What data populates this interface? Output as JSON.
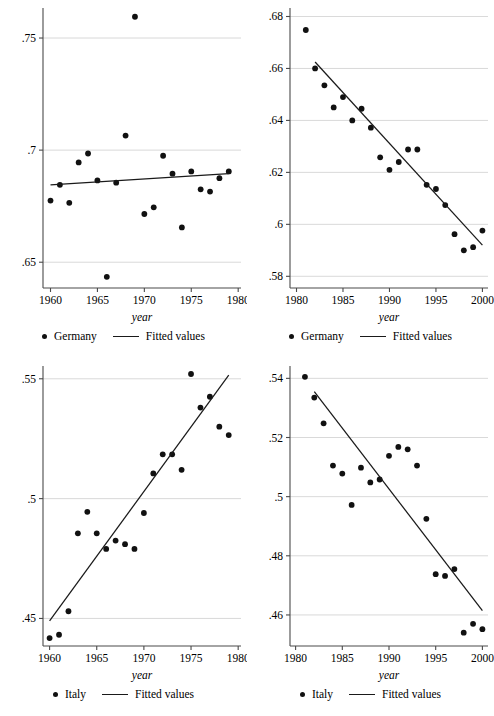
{
  "figure": {
    "panel_count": 4,
    "legend_marker_names": [
      "scatter-dot-marker",
      "fitted-line-marker"
    ]
  },
  "chart_data": [
    {
      "id": "germany-1960-1979",
      "type": "scatter",
      "title": "",
      "xlabel": "year",
      "ylabel": "",
      "xlim": [
        1959.2,
        1980.3
      ],
      "ylim": [
        0.6385,
        0.7625
      ],
      "xticks": [
        1960,
        1965,
        1970,
        1975,
        1980
      ],
      "xticklabels": [
        "1960",
        "1965",
        "1970",
        "1975",
        "1980"
      ],
      "yticks": [
        0.65,
        0.7,
        0.75
      ],
      "yticklabels": [
        ".65",
        ".7",
        ".75"
      ],
      "grid": true,
      "legend": [
        "Germany",
        "Fitted values"
      ],
      "legend_position": "bottom",
      "series": [
        {
          "name": "Germany",
          "kind": "points",
          "x": [
            1960,
            1961,
            1962,
            1963,
            1964,
            1965,
            1966,
            1967,
            1968,
            1969,
            1970,
            1971,
            1972,
            1973,
            1974,
            1975,
            1976,
            1977,
            1978,
            1979
          ],
          "y": [
            0.6775,
            0.6845,
            0.6765,
            0.6945,
            0.6985,
            0.6865,
            0.6435,
            0.6855,
            0.7065,
            0.7595,
            0.6715,
            0.6745,
            0.6975,
            0.6895,
            0.6655,
            0.6905,
            0.6825,
            0.6815,
            0.6875,
            0.6905
          ]
        },
        {
          "name": "Fitted values",
          "kind": "line",
          "x": [
            1960,
            1979
          ],
          "y": [
            0.6845,
            0.6895
          ]
        }
      ]
    },
    {
      "id": "germany-1981-2000",
      "type": "scatter",
      "title": "",
      "xlabel": "year",
      "ylabel": "",
      "xlim": [
        1979.3,
        2000.6
      ],
      "ylim": [
        0.5755,
        0.6825
      ],
      "xticks": [
        1980,
        1985,
        1990,
        1995,
        2000
      ],
      "xticklabels": [
        "1980",
        "1985",
        "1990",
        "1995",
        "2000"
      ],
      "yticks": [
        0.58,
        0.6,
        0.62,
        0.64,
        0.66,
        0.68
      ],
      "yticklabels": [
        ".58",
        ".6",
        ".62",
        ".64",
        ".66",
        ".68"
      ],
      "grid": true,
      "legend": [
        "Germany",
        "Fitted values"
      ],
      "legend_position": "bottom",
      "series": [
        {
          "name": "Germany",
          "kind": "points",
          "x": [
            1981,
            1982,
            1983,
            1984,
            1985,
            1986,
            1987,
            1988,
            1989,
            1990,
            1991,
            1992,
            1993,
            1994,
            1995,
            1996,
            1997,
            1998,
            1999,
            2000
          ],
          "y": [
            0.6748,
            0.66,
            0.6535,
            0.645,
            0.649,
            0.64,
            0.6445,
            0.6372,
            0.6258,
            0.621,
            0.624,
            0.6288,
            0.6288,
            0.6152,
            0.6136,
            0.6074,
            0.5962,
            0.59,
            0.5912,
            0.5976
          ]
        },
        {
          "name": "Fitted values",
          "kind": "line",
          "x": [
            1982,
            2000
          ],
          "y": [
            0.6625,
            0.592
          ]
        }
      ]
    },
    {
      "id": "italy-1960-1979",
      "type": "scatter",
      "title": "",
      "xlabel": "year",
      "ylabel": "",
      "xlim": [
        1959.3,
        1980.3
      ],
      "ylim": [
        0.4385,
        0.5545
      ],
      "xticks": [
        1960,
        1965,
        1970,
        1975,
        1980
      ],
      "xticklabels": [
        "1960",
        "1965",
        "1970",
        "1975",
        "1980"
      ],
      "yticks": [
        0.45,
        0.5,
        0.55
      ],
      "yticklabels": [
        ".45",
        ".5",
        ".55"
      ],
      "grid": true,
      "legend": [
        "Italy",
        "Fitted values"
      ],
      "legend_position": "bottom",
      "series": [
        {
          "name": "Italy",
          "kind": "points",
          "x": [
            1960,
            1961,
            1962,
            1963,
            1964,
            1965,
            1966,
            1967,
            1968,
            1969,
            1970,
            1971,
            1972,
            1973,
            1974,
            1975,
            1976,
            1977,
            1978,
            1979
          ],
          "y": [
            0.4418,
            0.4432,
            0.453,
            0.4855,
            0.4945,
            0.4855,
            0.479,
            0.4825,
            0.481,
            0.479,
            0.494,
            0.5105,
            0.5185,
            0.5185,
            0.512,
            0.552,
            0.538,
            0.5425,
            0.53,
            0.5265
          ]
        },
        {
          "name": "Fitted values",
          "kind": "line",
          "x": [
            1960,
            1979
          ],
          "y": [
            0.449,
            0.5515
          ]
        }
      ]
    },
    {
      "id": "italy-1981-2000",
      "type": "scatter",
      "title": "",
      "xlabel": "year",
      "ylabel": "",
      "xlim": [
        1979.4,
        2000.6
      ],
      "ylim": [
        0.4495,
        0.5435
      ],
      "xticks": [
        1980,
        1985,
        1990,
        1995,
        2000
      ],
      "xticklabels": [
        "1980",
        "1985",
        "1990",
        "1995",
        "2000"
      ],
      "yticks": [
        0.46,
        0.48,
        0.5,
        0.52,
        0.54
      ],
      "yticklabels": [
        ".46",
        ".48",
        ".5",
        ".52",
        ".54"
      ],
      "grid": true,
      "legend": [
        "Italy",
        "Fitted values"
      ],
      "legend_position": "bottom",
      "series": [
        {
          "name": "Italy",
          "kind": "points",
          "x": [
            1981,
            1982,
            1983,
            1984,
            1985,
            1986,
            1987,
            1988,
            1989,
            1990,
            1991,
            1992,
            1993,
            1994,
            1995,
            1996,
            1997,
            1998,
            1999,
            2000
          ],
          "y": [
            0.5405,
            0.5335,
            0.5248,
            0.5105,
            0.5078,
            0.4972,
            0.5098,
            0.5048,
            0.5058,
            0.5138,
            0.5168,
            0.516,
            0.5105,
            0.4925,
            0.4738,
            0.4732,
            0.4755,
            0.454,
            0.457,
            0.4552
          ]
        },
        {
          "name": "Fitted values",
          "kind": "line",
          "x": [
            1982,
            2000
          ],
          "y": [
            0.5355,
            0.4615
          ]
        }
      ]
    }
  ]
}
